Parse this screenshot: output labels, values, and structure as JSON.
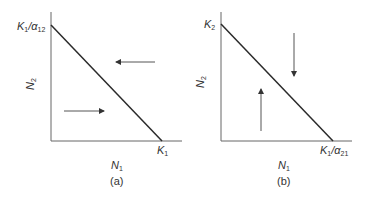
{
  "panels": [
    {
      "id": "a",
      "caption": "(a)",
      "y_axis_label": {
        "main": "N",
        "sub": "2"
      },
      "x_axis_label": {
        "main": "N",
        "sub": "1"
      },
      "y_intercept_label": {
        "main": "K",
        "sub1": "1",
        "sep": "/α",
        "sub2": "12"
      },
      "x_intercept_label": {
        "main": "K",
        "sub": "1"
      },
      "arrows": [
        {
          "direction": "left",
          "region": "above-line"
        },
        {
          "direction": "right",
          "region": "below-line"
        }
      ]
    },
    {
      "id": "b",
      "caption": "(b)",
      "y_axis_label": {
        "main": "N",
        "sub": "2"
      },
      "x_axis_label": {
        "main": "N",
        "sub": "1"
      },
      "y_intercept_label": {
        "main": "K",
        "sub": "2"
      },
      "x_intercept_label": {
        "main": "K",
        "sub1": "1",
        "sep": "/α",
        "sub2": "21"
      },
      "arrows": [
        {
          "direction": "down",
          "region": "above-line"
        },
        {
          "direction": "up",
          "region": "below-line"
        }
      ]
    }
  ],
  "colors": {
    "axis": "#555555",
    "isocline": "#2a2a2a",
    "arrow": "#444444"
  }
}
